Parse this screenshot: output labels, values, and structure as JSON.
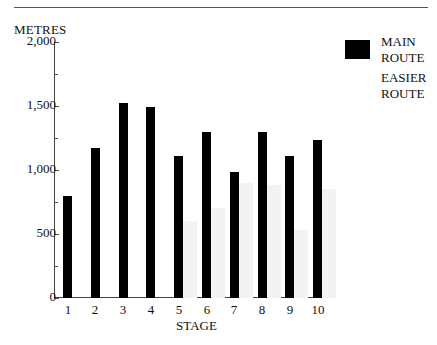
{
  "chart_data": {
    "type": "bar",
    "title": "",
    "xlabel": "STAGE",
    "ylabel": "METRES",
    "ylim": [
      0,
      2000
    ],
    "yticks": [
      0,
      500,
      1000,
      1500,
      2000
    ],
    "ytick_labels": [
      "0",
      "500",
      "1,000",
      "1,500",
      "2,000"
    ],
    "minor_yticks": [
      250,
      750,
      1250,
      1750
    ],
    "grid": false,
    "legend_position": "right",
    "categories": [
      "1",
      "2",
      "3",
      "4",
      "5",
      "6",
      "7",
      "8",
      "9",
      "10"
    ],
    "series": [
      {
        "name": "MAIN ROUTE",
        "color": "#000000",
        "values": [
          800,
          1175,
          1525,
          1490,
          1110,
          1300,
          985,
          1300,
          1110,
          1235
        ]
      },
      {
        "name": "EASIER ROUTE",
        "color": "#f3f3f3",
        "values": [
          null,
          null,
          null,
          null,
          600,
          700,
          900,
          880,
          530,
          850
        ]
      }
    ]
  },
  "legend": {
    "main_line1": "MAIN",
    "main_line2": "ROUTE",
    "easier_line1": "EASIER",
    "easier_line2": "ROUTE"
  }
}
